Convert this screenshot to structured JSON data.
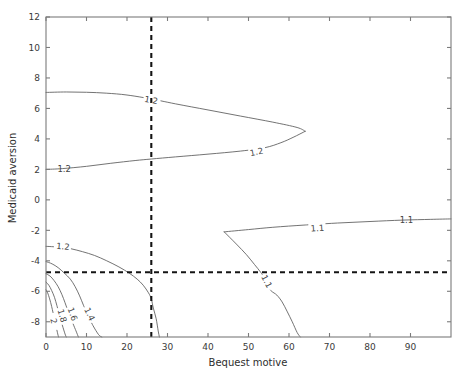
{
  "chart_data": {
    "type": "line",
    "subtype": "contour",
    "title": "",
    "xlabel": "Bequest motive",
    "ylabel": "Medicaid aversion",
    "xlim": [
      0,
      100
    ],
    "ylim": [
      -9,
      12
    ],
    "xticks": [
      0,
      10,
      20,
      30,
      40,
      50,
      60,
      70,
      80,
      90
    ],
    "xtick_labels": [
      "0",
      "10",
      "20",
      "30",
      "40",
      "50",
      "60",
      "70",
      "80",
      "90"
    ],
    "yticks": [
      -8,
      -6,
      -4,
      -2,
      0,
      2,
      4,
      6,
      8,
      10,
      12
    ],
    "ytick_labels": [
      "-8",
      "-6",
      "-4",
      "-2",
      "0",
      "2",
      "4",
      "6",
      "8",
      "10",
      "12"
    ],
    "grid": false,
    "legend": null,
    "line_color": "#5a5a5a",
    "axis_color": "#7b7b7b",
    "reference_line_color": "#141414",
    "reference_lines": [
      {
        "orientation": "vertical",
        "value": 26,
        "style": "dashed"
      },
      {
        "orientation": "horizontal",
        "value": -4.75,
        "style": "dashed"
      }
    ],
    "contours": [
      {
        "level": 1.2,
        "label": "1.2",
        "label_x": 26,
        "label_y": 6.55,
        "points": [
          [
            0,
            7.05
          ],
          [
            5,
            7.08
          ],
          [
            10,
            7.06
          ],
          [
            15,
            7.0
          ],
          [
            20,
            6.88
          ],
          [
            26,
            6.62
          ],
          [
            32,
            6.3
          ],
          [
            40,
            5.9
          ],
          [
            48,
            5.5
          ],
          [
            56,
            5.1
          ],
          [
            62,
            4.75
          ],
          [
            64,
            4.5
          ]
        ]
      },
      {
        "level": 1.2,
        "label": "1.2",
        "label_x": 52,
        "label_y": 3.15,
        "points": [
          [
            0,
            2.0
          ],
          [
            4,
            2.05
          ],
          [
            10,
            2.2
          ],
          [
            16,
            2.4
          ],
          [
            22,
            2.58
          ],
          [
            26,
            2.68
          ],
          [
            32,
            2.82
          ],
          [
            40,
            3.0
          ],
          [
            48,
            3.2
          ],
          [
            54,
            3.42
          ],
          [
            58,
            3.75
          ],
          [
            61,
            4.1
          ],
          [
            64,
            4.5
          ]
        ]
      },
      {
        "level": 1.2,
        "label": "1.2",
        "label_x": 4.5,
        "label_y": 2.0,
        "points": [],
        "label_only": true
      },
      {
        "level": 1.2,
        "label": "1.2",
        "label_x": 4.2,
        "label_y": -3.05,
        "points": [
          [
            0,
            -3.05
          ],
          [
            3,
            -3.1
          ],
          [
            6,
            -3.2
          ],
          [
            9,
            -3.4
          ],
          [
            12,
            -3.65
          ],
          [
            15,
            -4.0
          ],
          [
            18,
            -4.4
          ],
          [
            20.5,
            -4.8
          ],
          [
            22.5,
            -5.2
          ],
          [
            24,
            -5.6
          ],
          [
            25.3,
            -6.1
          ],
          [
            26,
            -6.5
          ],
          [
            26.5,
            -7.1
          ],
          [
            27.2,
            -7.8
          ],
          [
            27.7,
            -8.6
          ],
          [
            28,
            -9.0
          ]
        ]
      },
      {
        "level": 1.4,
        "label": "1.4",
        "label_x": 10.8,
        "label_y": -7.5,
        "points": [
          [
            0,
            -4.05
          ],
          [
            1.5,
            -4.2
          ],
          [
            3,
            -4.45
          ],
          [
            4.5,
            -4.8
          ],
          [
            6,
            -5.2
          ],
          [
            7.2,
            -5.7
          ],
          [
            8.3,
            -6.3
          ],
          [
            9.3,
            -6.95
          ],
          [
            10.4,
            -7.6
          ],
          [
            11.6,
            -8.25
          ],
          [
            13,
            -8.85
          ],
          [
            13.8,
            -9.0
          ]
        ]
      },
      {
        "level": 1.6,
        "label": "1.6",
        "label_x": 6.6,
        "label_y": -7.5,
        "points": [
          [
            0,
            -4.85
          ],
          [
            1,
            -5.0
          ],
          [
            2,
            -5.3
          ],
          [
            3,
            -5.7
          ],
          [
            3.9,
            -6.2
          ],
          [
            4.7,
            -6.75
          ],
          [
            5.5,
            -7.35
          ],
          [
            6.4,
            -7.95
          ],
          [
            7.4,
            -8.6
          ],
          [
            8,
            -9.0
          ]
        ]
      },
      {
        "level": 1.8,
        "label": "1.8",
        "label_x": 4.0,
        "label_y": -7.6,
        "points": [
          [
            0,
            -5.4
          ],
          [
            0.7,
            -5.6
          ],
          [
            1.4,
            -5.95
          ],
          [
            2.1,
            -6.4
          ],
          [
            2.7,
            -6.95
          ],
          [
            3.3,
            -7.55
          ],
          [
            4.0,
            -8.2
          ],
          [
            4.7,
            -8.8
          ],
          [
            5.0,
            -9.0
          ]
        ]
      },
      {
        "level": 2.0,
        "label": "2",
        "label_x": 1.9,
        "label_y": -7.95,
        "points": [
          [
            0,
            -5.9
          ],
          [
            0.4,
            -6.1
          ],
          [
            0.9,
            -6.5
          ],
          [
            1.4,
            -7.0
          ],
          [
            1.9,
            -7.6
          ],
          [
            2.4,
            -8.2
          ],
          [
            2.9,
            -8.8
          ],
          [
            3.1,
            -9.0
          ]
        ]
      },
      {
        "level": 1.1,
        "label": "1.1",
        "label_x": 67,
        "label_y": -1.85,
        "points": [
          [
            44,
            -2.1
          ],
          [
            50,
            -1.95
          ],
          [
            56,
            -1.8
          ],
          [
            64,
            -1.65
          ],
          [
            72,
            -1.52
          ],
          [
            80,
            -1.42
          ],
          [
            88,
            -1.33
          ],
          [
            95,
            -1.28
          ],
          [
            100,
            -1.25
          ]
        ]
      },
      {
        "level": 1.1,
        "label": "1.1",
        "label_x": 89,
        "label_y": -1.3,
        "points": [],
        "label_only": true
      },
      {
        "level": 1.1,
        "label": "1.1",
        "label_x": 54.5,
        "label_y": -5.35,
        "points": [
          [
            44,
            -2.1
          ],
          [
            47,
            -2.9
          ],
          [
            49.5,
            -3.6
          ],
          [
            51.5,
            -4.25
          ],
          [
            53,
            -4.75
          ],
          [
            54.2,
            -5.25
          ],
          [
            55,
            -5.75
          ],
          [
            55.7,
            -6.0
          ],
          [
            57,
            -6.25
          ],
          [
            58.3,
            -6.7
          ],
          [
            59.5,
            -7.3
          ],
          [
            60.8,
            -8.0
          ],
          [
            62,
            -8.7
          ],
          [
            62.8,
            -9.0
          ]
        ]
      }
    ]
  },
  "figure": {
    "background": "#ffffff",
    "width": 473,
    "height": 381
  }
}
